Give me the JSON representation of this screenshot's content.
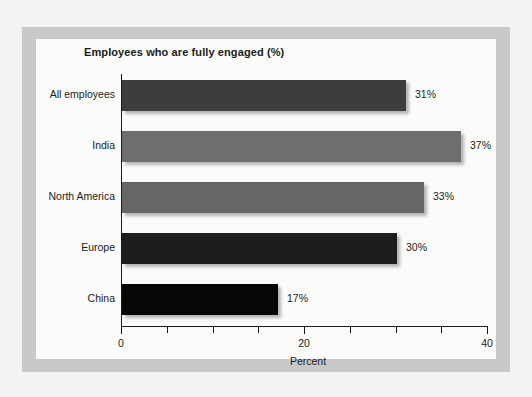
{
  "chart_data": {
    "type": "bar",
    "orientation": "horizontal",
    "title": "Employees who are fully engaged (%)",
    "xlabel": "Percent",
    "ylabel": "",
    "xlim": [
      0,
      40
    ],
    "grid": false,
    "legend": "none",
    "categories": [
      "All employees",
      "India",
      "North America",
      "Europe",
      "China"
    ],
    "values": [
      31,
      37,
      33,
      30,
      17
    ],
    "value_labels": [
      "31%",
      "37%",
      "33%",
      "30%",
      "17%"
    ],
    "bar_colors": [
      "#3d3d3d",
      "#6e6e6e",
      "#666666",
      "#1d1d1d",
      "#070707"
    ],
    "x_ticks_major": [
      0,
      20,
      40
    ],
    "x_tick_labels": [
      "0",
      "20",
      "40"
    ],
    "x_ticks_minor": [
      5,
      10,
      15,
      25,
      30,
      35
    ]
  },
  "chart": {
    "title": "Employees who are fully engaged (%)",
    "axis_title": "Percent",
    "bars": [
      {
        "label": "All employees",
        "value": 31,
        "value_label": "31%",
        "color": "#3d3d3d"
      },
      {
        "label": "India",
        "value": 37,
        "value_label": "37%",
        "color": "#6e6e6e"
      },
      {
        "label": "North America",
        "value": 33,
        "value_label": "33%",
        "color": "#666666"
      },
      {
        "label": "Europe",
        "value": 30,
        "value_label": "30%",
        "color": "#1d1d1d"
      },
      {
        "label": "China",
        "value": 17,
        "value_label": "17%",
        "color": "#070707"
      }
    ],
    "ticks": [
      {
        "value": 0,
        "label": "0",
        "major": true
      },
      {
        "value": 5,
        "label": "",
        "major": false
      },
      {
        "value": 10,
        "label": "",
        "major": false
      },
      {
        "value": 15,
        "label": "",
        "major": false
      },
      {
        "value": 20,
        "label": "20",
        "major": true
      },
      {
        "value": 25,
        "label": "",
        "major": false
      },
      {
        "value": 30,
        "label": "",
        "major": false
      },
      {
        "value": 35,
        "label": "",
        "major": false
      },
      {
        "value": 40,
        "label": "40",
        "major": true
      }
    ]
  }
}
